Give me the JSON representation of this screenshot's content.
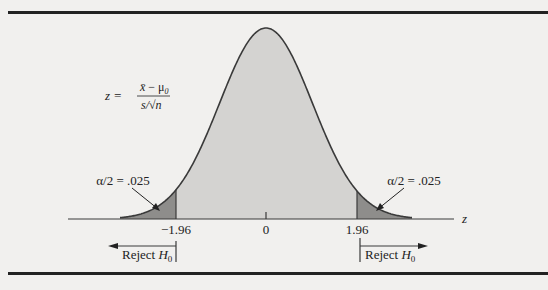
{
  "chart_data": {
    "type": "area",
    "title": "",
    "xlabel": "z",
    "ylabel": "",
    "tick_labels": [
      "-1.96",
      "0",
      "1.96"
    ],
    "tick_values": [
      -1.96,
      0,
      1.96
    ],
    "formula": {
      "lhs": "z =",
      "numerator": "x̄ − μ0",
      "denominator": "s/√n"
    },
    "annotations": [
      {
        "text": "α/2 = .025",
        "region": "left tail",
        "z_max": -1.96,
        "area": 0.025
      },
      {
        "text": "α/2 = .025",
        "region": "right tail",
        "z_min": 1.96,
        "area": 0.025
      }
    ],
    "rejection_labels": [
      {
        "text": "Reject H0",
        "direction": "left",
        "boundary": -1.96
      },
      {
        "text": "Reject H0",
        "direction": "right",
        "boundary": 1.96
      }
    ],
    "colors": {
      "background": "#f1f0ee",
      "curve_fill": "#d4d3d1",
      "tail_fill": "#8e8d8b",
      "curve_line": "#3a3a3a",
      "rule": "#222222"
    }
  },
  "labels": {
    "z_axis": "z",
    "tick_left": "−1.96",
    "tick_center": "0",
    "tick_right": "1.96",
    "alpha_left": "α/2 = .025",
    "alpha_right": "α/2 = .025",
    "reject_word": "Reject ",
    "reject_h": "H",
    "reject_sub": "0",
    "formula_z": "z =",
    "formula_num_x": "x̄",
    "formula_num_rest": " − μ",
    "formula_num_sub": "0",
    "formula_den": "s/√n"
  }
}
